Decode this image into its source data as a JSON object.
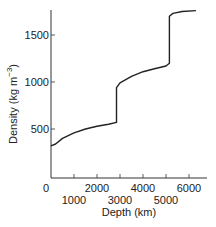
{
  "chart_data": {
    "type": "line",
    "title": "",
    "xlabel": "Depth (km)",
    "ylabel": "Density (kg m⁻³)",
    "xlim": [
      0,
      6500
    ],
    "ylim": [
      0,
      1800
    ],
    "grid": false,
    "legend": null,
    "x_ticks": [
      0,
      1000,
      2000,
      3000,
      4000,
      5000,
      6000
    ],
    "x_tick_labels_upper": [
      "0",
      "2000",
      "4000",
      "6000"
    ],
    "x_tick_labels_lower": [
      "1000",
      "3000",
      "5000"
    ],
    "y_ticks": [
      500,
      1000,
      1500
    ],
    "y_tick_labels": [
      "500",
      "1000",
      "1500"
    ],
    "series": [
      {
        "name": "Density",
        "x": [
          0,
          200,
          500,
          1000,
          1500,
          2000,
          2500,
          2850,
          2850,
          3000,
          3500,
          4000,
          4500,
          5000,
          5150,
          5150,
          5300,
          5700,
          6300
        ],
        "y": [
          320,
          340,
          400,
          460,
          500,
          530,
          550,
          570,
          940,
          990,
          1060,
          1110,
          1140,
          1170,
          1200,
          1700,
          1730,
          1750,
          1760
        ]
      }
    ]
  },
  "axes": {
    "x_title": "Depth (km)",
    "y_title_main": "Density (kg m",
    "y_title_sup": "−3",
    "y_title_close": ")"
  }
}
